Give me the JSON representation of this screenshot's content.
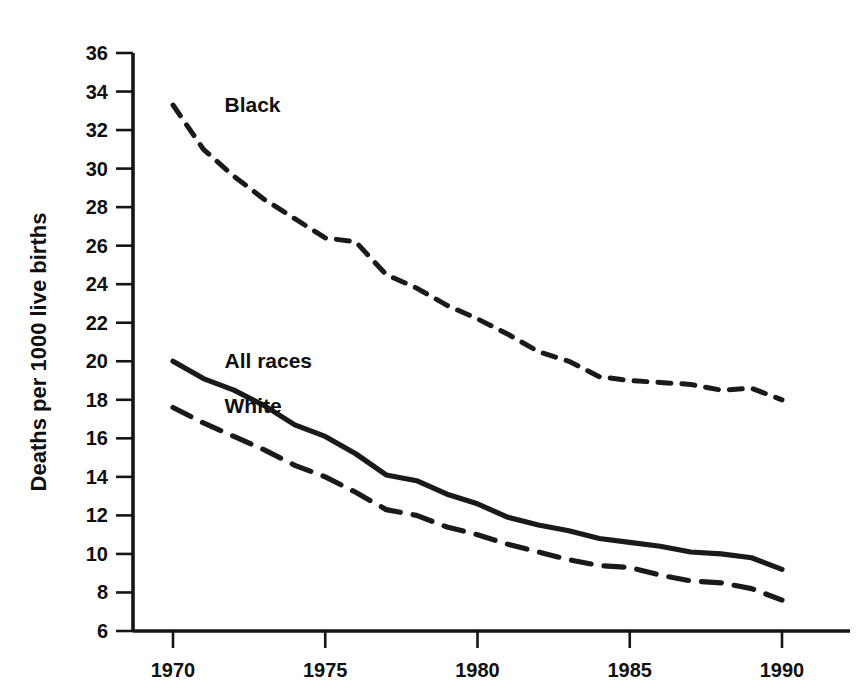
{
  "chart_data": {
    "type": "line",
    "title": "",
    "subtitle": "",
    "xlabel": "",
    "ylabel": "Deaths per 1000 live births",
    "xlim": [
      1969,
      1991
    ],
    "ylim": [
      6,
      36
    ],
    "grid": false,
    "legend_position": "inline-labels",
    "x_ticks": [
      "1970",
      "1975",
      "1980",
      "1985",
      "1990"
    ],
    "x_tick_values": [
      1970,
      1975,
      1980,
      1985,
      1990
    ],
    "y_ticks": [
      "6",
      "8",
      "10",
      "12",
      "14",
      "16",
      "18",
      "20",
      "22",
      "24",
      "26",
      "28",
      "30",
      "32",
      "34",
      "36"
    ],
    "y_tick_values": [
      6,
      8,
      10,
      12,
      14,
      16,
      18,
      20,
      22,
      24,
      26,
      28,
      30,
      32,
      34,
      36
    ],
    "x": [
      1970,
      1971,
      1972,
      1973,
      1974,
      1975,
      1976,
      1977,
      1978,
      1979,
      1980,
      1981,
      1982,
      1983,
      1984,
      1985,
      1986,
      1987,
      1988,
      1989,
      1990
    ],
    "series": [
      {
        "name": "Black",
        "style": "dashed-short",
        "label": "Black",
        "values": [
          33.3,
          31.0,
          29.6,
          28.4,
          27.4,
          26.4,
          26.2,
          24.5,
          23.8,
          22.9,
          22.2,
          21.4,
          20.5,
          20.0,
          19.2,
          19.0,
          18.9,
          18.8,
          18.5,
          18.6,
          18.0
        ]
      },
      {
        "name": "All races",
        "style": "solid",
        "label": "All races",
        "values": [
          20.0,
          19.1,
          18.5,
          17.7,
          16.7,
          16.1,
          15.2,
          14.1,
          13.8,
          13.1,
          12.6,
          11.9,
          11.5,
          11.2,
          10.8,
          10.6,
          10.4,
          10.1,
          10.0,
          9.8,
          9.2
        ]
      },
      {
        "name": "White",
        "style": "dashed-long",
        "label": "White",
        "values": [
          17.6,
          16.8,
          16.1,
          15.4,
          14.6,
          14.0,
          13.2,
          12.3,
          12.0,
          11.4,
          11.0,
          10.5,
          10.1,
          9.7,
          9.4,
          9.3,
          8.9,
          8.6,
          8.5,
          8.2,
          7.6
        ]
      }
    ],
    "annotations": [
      {
        "text": "Black",
        "x": 1971.1,
        "y": 33.3
      },
      {
        "text": "All races",
        "x": 1971.1,
        "y": 20.0
      },
      {
        "text": "White",
        "x": 1971.1,
        "y": 17.7
      }
    ]
  }
}
